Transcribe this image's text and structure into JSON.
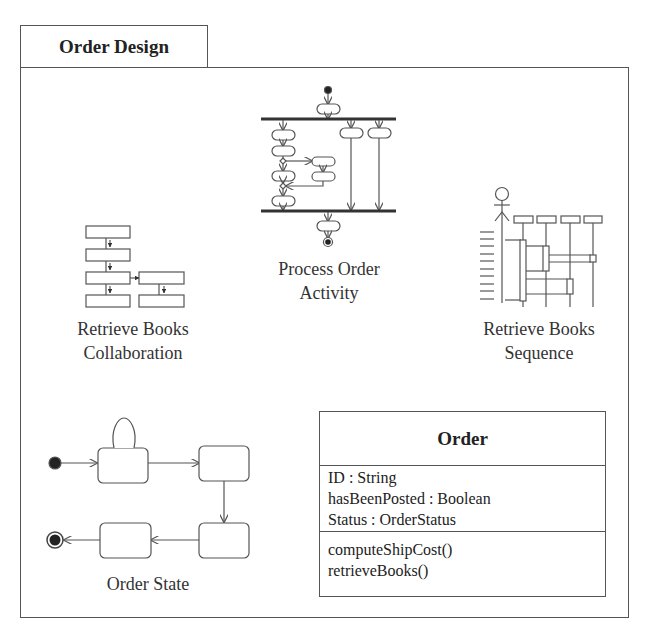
{
  "package": {
    "title": "Order Design"
  },
  "diagrams": {
    "activity": {
      "label_line1": "Process Order",
      "label_line2": "Activity",
      "icon": "activity-diagram-icon"
    },
    "collaboration": {
      "label_line1": "Retrieve Books",
      "label_line2": "Collaboration",
      "icon": "collaboration-diagram-icon"
    },
    "sequence": {
      "label_line1": "Retrieve Books",
      "label_line2": "Sequence",
      "icon": "sequence-diagram-icon"
    },
    "state": {
      "label": "Order State",
      "icon": "state-diagram-icon"
    }
  },
  "class": {
    "name": "Order",
    "attributes": [
      "ID : String",
      "hasBeenPosted : Boolean",
      "Status : OrderStatus"
    ],
    "operations": [
      "computeShipCost()",
      "retrieveBooks()"
    ]
  },
  "colors": {
    "line": "#555555",
    "background": "#ffffff",
    "text": "#222222"
  }
}
